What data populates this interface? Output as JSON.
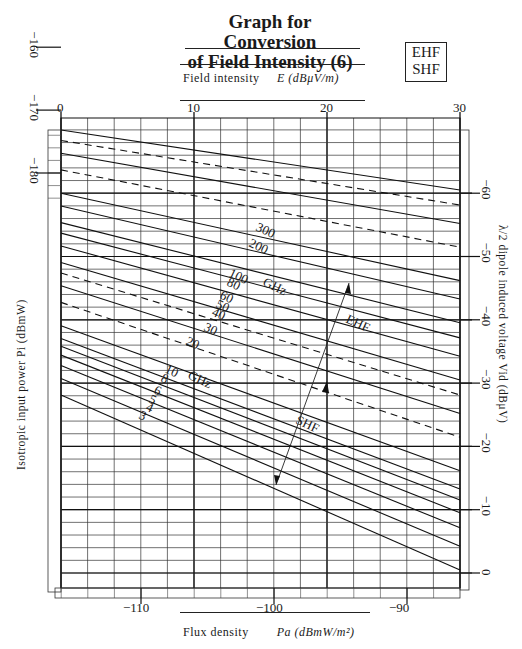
{
  "header": {
    "title_line1": "Graph for Conversion",
    "title_line2": "of Field Intensity (6)",
    "band_box_line1": "EHF",
    "band_box_line2": "SHF"
  },
  "axes": {
    "top_label_text": "Field intensity",
    "top_label_symbol": "E (dBμV/m)",
    "bottom_label_text": "Flux density",
    "bottom_label_symbol": "Pa (dBmW/m²)",
    "left_label": "Isotropic input power  Pi (dBmW)",
    "right_label": "λ/2 dipole induced voltage  Vid (dBμV)"
  },
  "chart_data": {
    "type": "line",
    "title": "Graph for Conversion of Field Intensity (6)",
    "subtitle": "EHF / SHF",
    "x_top": {
      "label": "Field intensity E (dBμV/m)",
      "ticks": [
        0,
        10,
        20,
        30
      ],
      "range": [
        0,
        30
      ]
    },
    "x_bottom": {
      "label": "Flux density Pa (dBmW/m²)",
      "ticks": [
        -110,
        -100,
        -90
      ],
      "range": [
        -116,
        -86
      ]
    },
    "y_left": {
      "label": "Isotropic input power Pi (dBmW)",
      "ticks": [
        -180,
        -170,
        -160,
        -150,
        -140,
        -130,
        -120
      ]
    },
    "y_right": {
      "label": "λ/2 dipole induced voltage Vid (dBμV)",
      "ticks": [
        -60,
        -50,
        -40,
        -30,
        -20,
        -10,
        0
      ]
    },
    "grid": true,
    "series_unit": "GHz",
    "series": [
      {
        "name": "300",
        "style": "solid",
        "label": "300",
        "band": "EHF"
      },
      {
        "name": "250",
        "style": "dashed",
        "label": "",
        "band": "EHF"
      },
      {
        "name": "200",
        "style": "solid",
        "label": "200",
        "band": "EHF"
      },
      {
        "name": "150",
        "style": "dashed",
        "label": "",
        "band": "EHF"
      },
      {
        "name": "100",
        "style": "solid",
        "label": "100",
        "band": "EHF"
      },
      {
        "name": "80",
        "style": "solid",
        "label": "80",
        "band": "EHF"
      },
      {
        "name": "60",
        "style": "solid",
        "label": "60",
        "band": "EHF"
      },
      {
        "name": "50",
        "style": "solid",
        "label": "50",
        "band": "EHF"
      },
      {
        "name": "40",
        "style": "solid",
        "label": "40",
        "band": "EHF"
      },
      {
        "name": "30",
        "style": "solid",
        "label": "30",
        "band": "EHF"
      },
      {
        "name": "25",
        "style": "dashed",
        "label": "",
        "band": "EHF"
      },
      {
        "name": "20",
        "style": "solid",
        "label": "20",
        "band": "EHF"
      },
      {
        "name": "15",
        "style": "dashed",
        "label": "",
        "band": "SHF"
      },
      {
        "name": "10",
        "style": "solid",
        "label": "10",
        "band": "SHF"
      },
      {
        "name": "8",
        "style": "solid",
        "label": "8",
        "band": "SHF"
      },
      {
        "name": "7",
        "style": "solid",
        "label": "",
        "band": "SHF"
      },
      {
        "name": "6",
        "style": "solid",
        "label": "6",
        "band": "SHF"
      },
      {
        "name": "5",
        "style": "solid",
        "label": "5",
        "band": "SHF"
      },
      {
        "name": "4",
        "style": "solid",
        "label": "4",
        "band": "SHF"
      },
      {
        "name": "3",
        "style": "solid",
        "label": "3",
        "band": "SHF"
      }
    ],
    "annotations": [
      "GHz",
      "GHz",
      "EHF",
      "SHF"
    ]
  },
  "annotations": {
    "ghz_upper": "GHz",
    "ghz_lower": "GHz",
    "ehf": "EHF",
    "shf": "SHF"
  }
}
